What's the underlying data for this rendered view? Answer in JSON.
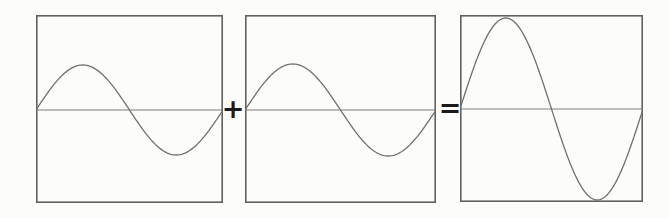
{
  "figure": {
    "operators": {
      "plus": "+",
      "equals": "="
    },
    "colors": {
      "background": "#fcfcfa",
      "frame": "#606060",
      "midline": "#7d7d7d",
      "wave": "#6f6f6f",
      "operator": "#1a1a1a"
    },
    "panels": [
      {
        "name": "wave-a",
        "x": 36,
        "y": 15,
        "width": 187,
        "height": 188,
        "midline_y": 95,
        "wave": {
          "type": "sine",
          "amplitude": 45,
          "cycles": 1,
          "phase_deg": 0
        }
      },
      {
        "name": "wave-b",
        "x": 245,
        "y": 15,
        "width": 191,
        "height": 188,
        "midline_y": 95,
        "wave": {
          "type": "sine",
          "amplitude": 46,
          "cycles": 1,
          "phase_deg": 0
        }
      },
      {
        "name": "wave-sum",
        "x": 460,
        "y": 15,
        "width": 183,
        "height": 187,
        "midline_y": 94,
        "wave": {
          "type": "sine",
          "amplitude": 91,
          "cycles": 1,
          "phase_deg": 0
        }
      }
    ]
  },
  "chart_data": {
    "type": "line",
    "x_range_per_panel": [
      0,
      1
    ],
    "series": [
      {
        "name": "wave-a",
        "equation": "y = A*sin(2*pi*x)",
        "amplitude_px": 45,
        "cycles": 1,
        "phase_deg": 0
      },
      {
        "name": "wave-b",
        "equation": "y = A*sin(2*pi*x)",
        "amplitude_px": 46,
        "cycles": 1,
        "phase_deg": 0
      },
      {
        "name": "wave-sum",
        "equation": "y = 2A*sin(2*pi*x)",
        "amplitude_px": 91,
        "cycles": 1,
        "phase_deg": 0
      }
    ],
    "legend": "none",
    "grid": false,
    "axes": "horizontal midline only, boxed frame"
  }
}
